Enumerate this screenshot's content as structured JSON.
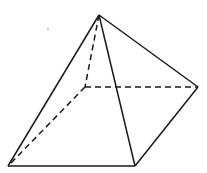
{
  "diagram": {
    "type": "square-pyramid",
    "colors": {
      "stroke": "#1a1a1a",
      "background": "#ffffff"
    },
    "vertices": {
      "apex": [
        99,
        15
      ],
      "front_left": [
        8,
        166
      ],
      "front_right": [
        135,
        166
      ],
      "back_right": [
        198,
        87
      ],
      "back_left_hidden": [
        85,
        87
      ]
    },
    "solid_edges": [
      [
        "apex",
        "front_left"
      ],
      [
        "apex",
        "front_right"
      ],
      [
        "apex",
        "back_right"
      ],
      [
        "front_left",
        "front_right"
      ],
      [
        "front_right",
        "back_right"
      ]
    ],
    "hidden_edges": [
      [
        "apex",
        "back_left_hidden"
      ],
      [
        "back_left_hidden",
        "front_left"
      ],
      [
        "back_left_hidden",
        "back_right"
      ]
    ]
  }
}
